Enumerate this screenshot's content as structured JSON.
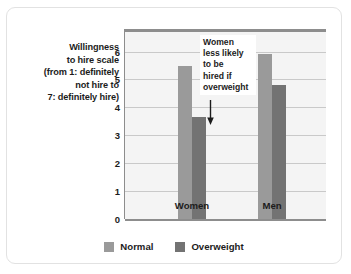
{
  "axis_caption": {
    "lines": [
      "Willingness",
      "to hire scale",
      "(from 1: definitely",
      "not hire to",
      "7: definitely hire)"
    ]
  },
  "annotation": {
    "lines": [
      "Women",
      "less likely",
      "to be",
      "hired if",
      "overweight"
    ],
    "arrow_icon": "down-arrow-icon"
  },
  "colors": {
    "normal": "#9a9a9a",
    "overweight": "#737373",
    "plot_background": "#f4f4f4",
    "gridline": "#c9c9c9",
    "axis": "#8d8d8d",
    "card_border": "#e2e2e2",
    "text": "#1c1c1c"
  },
  "chart_data": {
    "type": "bar",
    "title": "",
    "xlabel": "",
    "ylabel": "Willingness to hire scale (from 1: definitely not hire to 7: definitely hire)",
    "categories": [
      "Women",
      "Men"
    ],
    "series": [
      {
        "name": "Normal",
        "values": [
          5.5,
          5.9
        ],
        "color": "#9a9a9a"
      },
      {
        "name": "Overweight",
        "values": [
          3.65,
          4.8
        ],
        "color": "#737373"
      }
    ],
    "ylim": [
      0,
      6.7
    ],
    "yticks": [
      0,
      1,
      2,
      3,
      4,
      5,
      6
    ],
    "ytick_labels": [
      "0",
      "1",
      "2",
      "3",
      "4",
      "5",
      "6"
    ],
    "grid": true,
    "legend_position": "bottom",
    "annotations": [
      {
        "text": "Women less likely to be hired if overweight",
        "points_to": {
          "category": "Women",
          "series": "Overweight"
        }
      }
    ]
  }
}
